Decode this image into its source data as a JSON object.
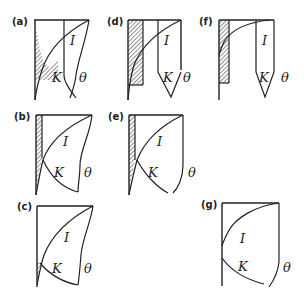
{
  "panels": [
    {
      "id": "a",
      "label": "(a)",
      "I": "I",
      "K": "K",
      "theta": "θ"
    },
    {
      "id": "d",
      "label": "(d)",
      "I": "I",
      "K": "K",
      "theta": "θ"
    },
    {
      "id": "f",
      "label": "(f)",
      "I": "I",
      "K": "K",
      "theta": "θ"
    },
    {
      "id": "b",
      "label": "(b)",
      "I": "I",
      "K": "K",
      "theta": "θ"
    },
    {
      "id": "e",
      "label": "(e)",
      "I": "I",
      "K": "K",
      "theta": "θ"
    },
    {
      "id": "c",
      "label": "(c)",
      "I": "I",
      "K": "K",
      "theta": "θ"
    },
    {
      "id": "g",
      "label": "(g)",
      "I": "I",
      "K": "K",
      "theta": "θ"
    }
  ],
  "colors": {
    "line": "#222222",
    "hatch": "#222222",
    "background": "#ffffff"
  }
}
